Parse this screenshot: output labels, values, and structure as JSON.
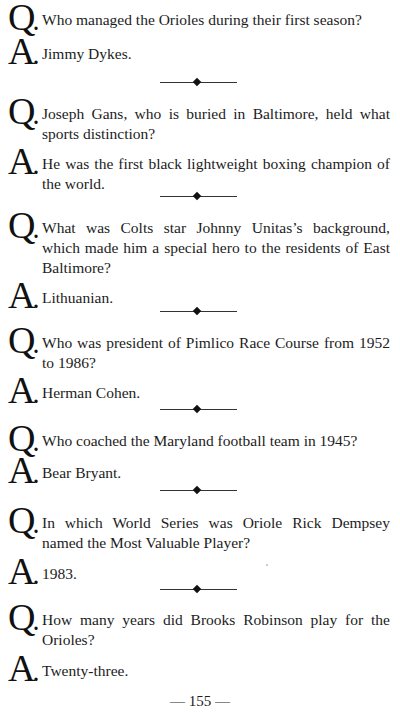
{
  "labels": {
    "question": "Q",
    "answer": "A",
    "dot": "."
  },
  "items": [
    {
      "question": "Who managed the Orioles during their first season?",
      "answer": "Jimmy Dykes."
    },
    {
      "question": "Joseph Gans, who is buried in Baltimore, held what sports distinction?",
      "answer": "He was the first black lightweight boxing champion of the world."
    },
    {
      "question": "What was Colts star Johnny Unitas’s background, which made him a special hero to the residents of East Baltimore?",
      "answer": "Lithuanian."
    },
    {
      "question": "Who was president of Pimlico Race Course from 1952 to 1986?",
      "answer": "Herman Cohen."
    },
    {
      "question": "Who coached the Maryland football team in 1945?",
      "answer": "Bear Bryant."
    },
    {
      "question": "In which World Series was Oriole Rick Dempsey named the Most Valuable Player?",
      "answer": "1983."
    },
    {
      "question": "How many years did Brooks Robinson play for the Orioles?",
      "answer": "Twenty-three."
    }
  ],
  "footer": {
    "page_number": "— 155 —"
  }
}
